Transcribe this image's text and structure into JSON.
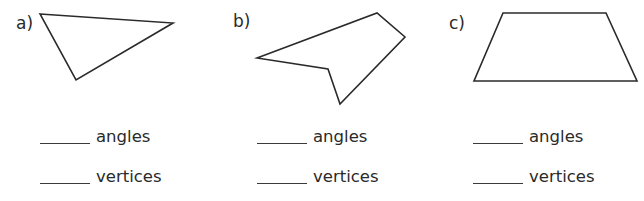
{
  "exercise": {
    "items": [
      {
        "label": "a)",
        "shape": "triangle",
        "points": "40,14 173,23 76,80",
        "answers": [
          {
            "blank": "",
            "word": "angles"
          },
          {
            "blank": "",
            "word": "vertices"
          }
        ]
      },
      {
        "label": "b)",
        "shape": "pentagon",
        "points": "257,58 377,13 405,37 340,104 328,69",
        "answers": [
          {
            "blank": "",
            "word": "angles"
          },
          {
            "blank": "",
            "word": "vertices"
          }
        ]
      },
      {
        "label": "c)",
        "shape": "trapezoid",
        "points": "503,13 606,13 637,81 474,81",
        "answers": [
          {
            "blank": "",
            "word": "angles"
          },
          {
            "blank": "",
            "word": "vertices"
          }
        ]
      }
    ]
  },
  "colors": {
    "stroke": "#2a2a2a",
    "background": "#ffffff"
  }
}
